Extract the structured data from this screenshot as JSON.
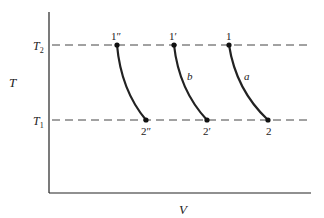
{
  "axes": {
    "x_label": "V",
    "y_label": "T",
    "y_ticks": [
      {
        "label": "T",
        "sub": "2",
        "y": 45
      },
      {
        "label": "T",
        "sub": "1",
        "y": 120
      }
    ]
  },
  "isotherms": [
    {
      "name": "T2",
      "y": 45
    },
    {
      "name": "T1",
      "y": 120
    }
  ],
  "curves": [
    {
      "id": "a",
      "label": "a",
      "start": {
        "label": "1",
        "x": 229,
        "y": 45
      },
      "end": {
        "label": "2",
        "x": 268,
        "y": 120
      }
    },
    {
      "id": "b",
      "label": "b",
      "start": {
        "label": "1′",
        "x": 174,
        "y": 45
      },
      "end": {
        "label": "2′",
        "x": 207,
        "y": 120
      }
    },
    {
      "id": "c",
      "label": "",
      "start": {
        "label": "1″",
        "x": 117,
        "y": 45
      },
      "end": {
        "label": "2″",
        "x": 146,
        "y": 120
      }
    }
  ],
  "colors": {
    "line": "#222222",
    "dash": "#444444"
  }
}
